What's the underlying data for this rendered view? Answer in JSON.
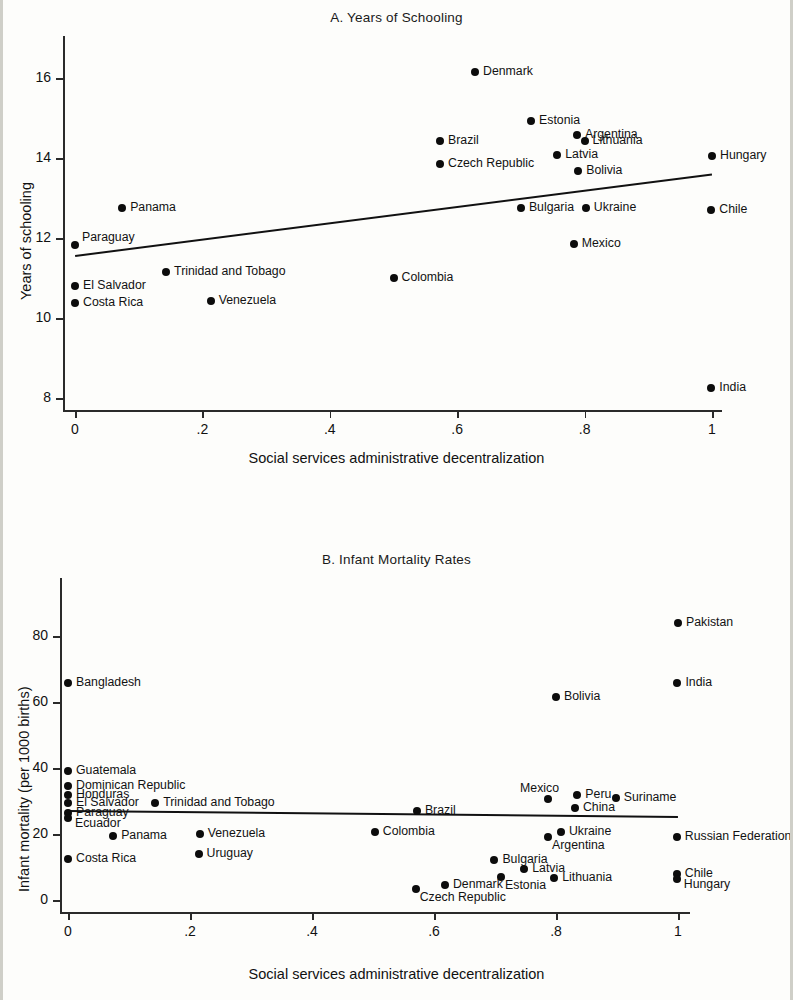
{
  "figure": {
    "xlabel": "Social services administrative decentralization",
    "xticks": [
      "0",
      ".2",
      ".4",
      ".6",
      ".8",
      "1"
    ],
    "xtick_values": [
      0,
      0.2,
      0.4,
      0.6,
      0.8,
      1
    ]
  },
  "chart_data": [
    {
      "type": "scatter",
      "title": "A. Years of Schooling",
      "xlabel": "Social services administrative decentralization",
      "ylabel": "Years of schooling",
      "xlim": [
        0,
        1
      ],
      "ylim": [
        8,
        16.5
      ],
      "xticks": [
        0,
        0.2,
        0.4,
        0.6,
        0.8,
        1
      ],
      "xticklabels": [
        "0",
        ".2",
        ".4",
        ".6",
        ".8",
        "1"
      ],
      "yticks": [
        8,
        10,
        12,
        14,
        16
      ],
      "yticklabels": [
        "8",
        "10",
        "12",
        "14",
        "16"
      ],
      "grid": false,
      "legend": "none",
      "fit_line": {
        "x0": 0,
        "y0": 11.58,
        "x1": 1,
        "y1": 13.62
      },
      "points": [
        {
          "label": "Denmark",
          "x": 0.628,
          "y": 16.16,
          "label_side": "right"
        },
        {
          "label": "Estonia",
          "x": 0.716,
          "y": 14.92,
          "label_side": "right"
        },
        {
          "label": "Argentina",
          "x": 0.788,
          "y": 14.58,
          "label_side": "right"
        },
        {
          "label": "Lithuania",
          "x": 0.8,
          "y": 14.42,
          "label_side": "right"
        },
        {
          "label": "Brazil",
          "x": 0.573,
          "y": 14.43,
          "label_side": "right"
        },
        {
          "label": "Latvia",
          "x": 0.757,
          "y": 14.07,
          "label_side": "right"
        },
        {
          "label": "Czech Republic",
          "x": 0.573,
          "y": 13.85,
          "label_side": "right"
        },
        {
          "label": "Hungary",
          "x": 1.0,
          "y": 14.04,
          "label_side": "right"
        },
        {
          "label": "Bolivia",
          "x": 0.79,
          "y": 13.68,
          "label_side": "right"
        },
        {
          "label": "Bulgaria",
          "x": 0.7,
          "y": 12.75,
          "label_side": "right"
        },
        {
          "label": "Ukraine",
          "x": 0.802,
          "y": 12.75,
          "label_side": "right"
        },
        {
          "label": "Chile",
          "x": 0.999,
          "y": 12.7,
          "label_side": "right"
        },
        {
          "label": "Panama",
          "x": 0.074,
          "y": 12.75,
          "label_side": "right"
        },
        {
          "label": "Mexico",
          "x": 0.783,
          "y": 11.85,
          "label_side": "right"
        },
        {
          "label": "Paraguay",
          "x": 0.0,
          "y": 11.82,
          "label_side": "right-above"
        },
        {
          "label": "Trinidad and Tobago",
          "x": 0.143,
          "y": 11.15,
          "label_side": "right"
        },
        {
          "label": "Colombia",
          "x": 0.5,
          "y": 11.0,
          "label_side": "right"
        },
        {
          "label": "El Salvador",
          "x": 0.0,
          "y": 10.8,
          "label_side": "right"
        },
        {
          "label": "Venezuela",
          "x": 0.213,
          "y": 10.42,
          "label_side": "right"
        },
        {
          "label": "Costa Rica",
          "x": 0.0,
          "y": 10.37,
          "label_side": "right"
        },
        {
          "label": "India",
          "x": 0.999,
          "y": 8.25,
          "label_side": "right"
        }
      ]
    },
    {
      "type": "scatter",
      "title": "B. Infant Mortality Rates",
      "xlabel": "Social services administrative decentralization",
      "ylabel": "Infant mortality (per 1000 births)",
      "xlim": [
        0,
        1
      ],
      "ylim": [
        0,
        88
      ],
      "xticks": [
        0,
        0.2,
        0.4,
        0.6,
        0.8,
        1
      ],
      "xticklabels": [
        "0",
        ".2",
        ".4",
        ".6",
        ".8",
        "1"
      ],
      "yticks": [
        0,
        20,
        40,
        60,
        80
      ],
      "yticklabels": [
        "0",
        "20",
        "40",
        "60",
        "80"
      ],
      "grid": false,
      "legend": "none",
      "fit_line": {
        "x0": 0,
        "y0": 27.2,
        "x1": 1,
        "y1": 25.4
      },
      "points": [
        {
          "label": "Pakistan",
          "x": 1.0,
          "y": 84.0,
          "label_side": "right"
        },
        {
          "label": "India",
          "x": 0.999,
          "y": 66.0,
          "label_side": "right"
        },
        {
          "label": "Bangladesh",
          "x": 0.0,
          "y": 66.0,
          "label_side": "right"
        },
        {
          "label": "Bolivia",
          "x": 0.8,
          "y": 61.5,
          "label_side": "right"
        },
        {
          "label": "Guatemala",
          "x": 0.0,
          "y": 39.0,
          "label_side": "right"
        },
        {
          "label": "Dominican Republic",
          "x": 0.0,
          "y": 34.5,
          "label_side": "right"
        },
        {
          "label": "Honduras",
          "x": 0.0,
          "y": 32.0,
          "label_side": "right"
        },
        {
          "label": "El Salvador",
          "x": 0.0,
          "y": 29.5,
          "label_side": "right"
        },
        {
          "label": "Paraguay",
          "x": 0.0,
          "y": 26.5,
          "label_side": "right"
        },
        {
          "label": "Ecuador",
          "x": 0.0,
          "y": 25.0,
          "label_side": "right-below"
        },
        {
          "label": "Trinidad and Tobago",
          "x": 0.143,
          "y": 29.5,
          "label_side": "right"
        },
        {
          "label": "Mexico",
          "x": 0.787,
          "y": 30.5,
          "label_side": "above"
        },
        {
          "label": "Peru",
          "x": 0.835,
          "y": 32.0,
          "label_side": "right"
        },
        {
          "label": "Suriname",
          "x": 0.898,
          "y": 31.0,
          "label_side": "right"
        },
        {
          "label": "China",
          "x": 0.831,
          "y": 28.0,
          "label_side": "right"
        },
        {
          "label": "Brazil",
          "x": 0.572,
          "y": 27.0,
          "label_side": "right"
        },
        {
          "label": "Ukraine",
          "x": 0.808,
          "y": 20.5,
          "label_side": "right"
        },
        {
          "label": "Argentina",
          "x": 0.787,
          "y": 19.0,
          "label_side": "below-right"
        },
        {
          "label": "Russian Federation",
          "x": 0.998,
          "y": 19.0,
          "label_side": "right"
        },
        {
          "label": "Colombia",
          "x": 0.503,
          "y": 20.5,
          "label_side": "right"
        },
        {
          "label": "Venezuela",
          "x": 0.216,
          "y": 20.0,
          "label_side": "right"
        },
        {
          "label": "Panama",
          "x": 0.074,
          "y": 19.5,
          "label_side": "right"
        },
        {
          "label": "Uruguay",
          "x": 0.214,
          "y": 14.0,
          "label_side": "right"
        },
        {
          "label": "Costa Rica",
          "x": 0.0,
          "y": 12.5,
          "label_side": "right"
        },
        {
          "label": "Bulgaria",
          "x": 0.699,
          "y": 12.0,
          "label_side": "right"
        },
        {
          "label": "Latvia",
          "x": 0.748,
          "y": 9.5,
          "label_side": "right"
        },
        {
          "label": "Estonia",
          "x": 0.71,
          "y": 7.0,
          "label_side": "below-right"
        },
        {
          "label": "Lithuania",
          "x": 0.797,
          "y": 6.8,
          "label_side": "right"
        },
        {
          "label": "Chile",
          "x": 0.998,
          "y": 8.0,
          "label_side": "right"
        },
        {
          "label": "Hungary",
          "x": 0.998,
          "y": 6.3,
          "label_side": "right-below"
        },
        {
          "label": "Denmark",
          "x": 0.618,
          "y": 4.5,
          "label_side": "right"
        },
        {
          "label": "Czech Republic",
          "x": 0.57,
          "y": 3.2,
          "label_side": "below-right"
        }
      ]
    }
  ]
}
